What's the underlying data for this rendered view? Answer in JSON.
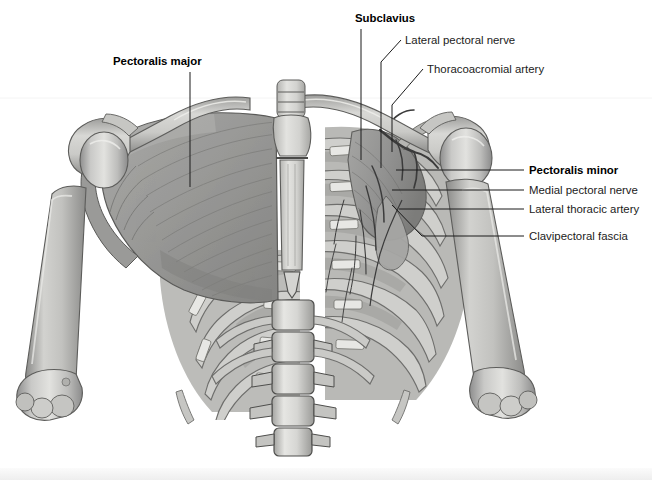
{
  "figure": {
    "background_color": "#ffffff",
    "bottom_band_color": "#f1f1f1",
    "label_color": "#1b1b1b",
    "leader_color": "#1b1b1b"
  },
  "labels": [
    {
      "id": "pectoralis-major",
      "text": "Pectoralis major",
      "bold": true,
      "x": 113,
      "y": 65,
      "anchor": "start",
      "leader": "M190,72 L190,187"
    },
    {
      "id": "subclavius",
      "text": "Subclavius",
      "bold": true,
      "x": 355,
      "y": 22,
      "anchor": "start",
      "leader": "M361,29 L361,160"
    },
    {
      "id": "lateral-pectoral-nerve",
      "text": "Lateral pectoral nerve",
      "bold": false,
      "x": 405,
      "y": 44,
      "anchor": "start",
      "leader": "M401,40 L381,62 L381,168"
    },
    {
      "id": "thoracoacromial-artery",
      "text": "Thoracoacromial artery",
      "bold": false,
      "x": 427,
      "y": 73,
      "anchor": "start",
      "leader": "M423,69 L392,105 L392,152"
    },
    {
      "id": "pectoralis-minor",
      "text": "Pectoralis minor",
      "bold": true,
      "x": 529,
      "y": 174,
      "anchor": "start",
      "leader": "M524,170 L396,170"
    },
    {
      "id": "medial-pectoral-nerve",
      "text": "Medial pectoral nerve",
      "bold": false,
      "x": 529,
      "y": 194,
      "anchor": "start",
      "leader": "M524,190 L392,190"
    },
    {
      "id": "lateral-thoracic-artery",
      "text": "Lateral thoracic artery",
      "bold": false,
      "x": 529,
      "y": 213,
      "anchor": "start",
      "leader": "M524,209 L399,209"
    },
    {
      "id": "clavipectoral-fascia",
      "text": "Clavipectoral fascia",
      "bold": false,
      "x": 529,
      "y": 240,
      "anchor": "start",
      "leader": "M524,236 L422,236 L392,205"
    }
  ],
  "structures": {
    "left_side": [
      "pectoralis-major-muscle",
      "left-clavicle",
      "left-acromion",
      "left-humerus",
      "left-rib-cage"
    ],
    "right_side": [
      "right-clavicle",
      "right-acromion",
      "right-humerus",
      "pectoralis-minor-muscle",
      "right-ribs",
      "intercostal-muscles",
      "axillary-vessels"
    ],
    "midline": [
      "trachea",
      "manubrium",
      "sternal-body",
      "xiphoid-process",
      "lumbar-vertebrae"
    ]
  }
}
